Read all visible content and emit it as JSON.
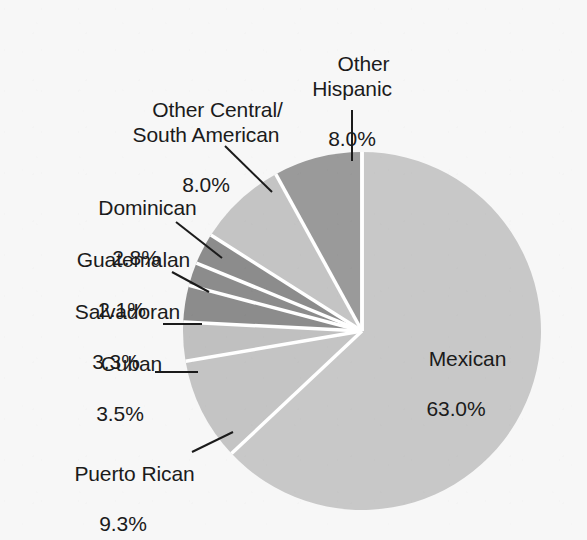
{
  "chart_data": {
    "type": "pie",
    "title": "",
    "subtitle": "",
    "xlabel": "",
    "ylabel": "",
    "legend_position": "none",
    "grid": false,
    "units": "percent",
    "start_angle_deg": 0,
    "direction": "clockwise",
    "categories": [
      "Mexican",
      "Puerto Rican",
      "Cuban",
      "Salvadoran",
      "Guatemalan",
      "Dominican",
      "Other Central/South American",
      "Other Hispanic"
    ],
    "values": [
      63.0,
      9.3,
      3.5,
      3.3,
      2.1,
      2.8,
      8.0,
      8.0
    ],
    "slices": [
      {
        "label": "Mexican",
        "value": 63.0,
        "value_text": "63.0%",
        "color": "#c8c8c8",
        "label_placement": "inside"
      },
      {
        "label": "Puerto Rican",
        "value": 9.3,
        "value_text": "9.3%",
        "color": "#c4c4c4",
        "label_placement": "outside"
      },
      {
        "label": "Cuban",
        "value": 3.5,
        "value_text": "3.5%",
        "color": "#c0c0c0",
        "label_placement": "outside"
      },
      {
        "label": "Salvadoran",
        "value": 3.3,
        "value_text": "3.3%",
        "color": "#8c8c8c",
        "label_placement": "outside"
      },
      {
        "label": "Guatemalan",
        "value": 2.1,
        "value_text": "2.1%",
        "color": "#8c8c8c",
        "label_placement": "outside"
      },
      {
        "label": "Dominican",
        "value": 2.8,
        "value_text": "2.8%",
        "color": "#8c8c8c",
        "label_placement": "outside"
      },
      {
        "label": "Other Central/South American",
        "value": 8.0,
        "value_text": "8.0%",
        "color": "#c4c4c4",
        "label_placement": "outside"
      },
      {
        "label": "Other Hispanic",
        "value": 8.0,
        "value_text": "8.0%",
        "color": "#9a9a9a",
        "label_placement": "outside"
      }
    ]
  },
  "labels": {
    "other_hispanic": {
      "name": "Other\nHispanic",
      "pct": "8.0%"
    },
    "other_central_south_american": {
      "name": "Other Central/\nSouth American",
      "pct": "8.0%"
    },
    "dominican": {
      "name": "Dominican",
      "pct": "2.8%"
    },
    "guatemalan": {
      "name": "Guatemalan",
      "pct": "2.1%"
    },
    "salvadoran": {
      "name": "Salvadoran",
      "pct": "3.3%"
    },
    "cuban": {
      "name": "Cuban",
      "pct": "3.5%"
    },
    "puerto_rican": {
      "name": "Puerto Rican",
      "pct": "9.3%"
    },
    "mexican": {
      "name": "Mexican",
      "pct": "63.0%"
    }
  },
  "colors": {
    "background": "#f7f7f7",
    "text": "#1b1b1b",
    "separator": "#ffffff",
    "leader_line": "#1b1b1b",
    "light_gray": "#c8c8c8",
    "mid_gray": "#9a9a9a",
    "dark_gray": "#8c8c8c"
  },
  "geometry": {
    "center_x": 362,
    "center_y": 331,
    "radius": 179
  }
}
